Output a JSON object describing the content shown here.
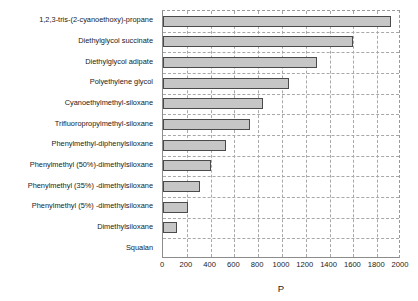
{
  "chart_data": {
    "type": "bar",
    "orientation": "horizontal",
    "title": "",
    "xlabel": "P",
    "ylabel": "",
    "xlim": [
      0,
      2000
    ],
    "xticks": [
      0,
      200,
      400,
      600,
      800,
      1000,
      1200,
      1400,
      1600,
      1800,
      2000
    ],
    "grid": true,
    "legend": false,
    "bar_fill_color": "#c6c6c6",
    "bar_border_color": "#4a4a4a",
    "categories": [
      "1,2,3-tris-(2-cyanoethoxy)-propane",
      "Diethylglycol succinate",
      "Diethylglycol adipate",
      "Polyethylene glycol",
      "Cyanoethylmethyl-siloxane",
      "Trifluoropropylmethyl-siloxane",
      "Phenylmethyl-diphenylsiloxane",
      "Phenylmethyl (50%)-dimethylsiloxane",
      "Phenylmethyl (35%) -dimethylsiloxane",
      "Phenylmethyl (5%) -dimethylsiloxane",
      "Dimethylsiloxane",
      "Squalan"
    ],
    "values": [
      1915,
      1595,
      1295,
      1060,
      840,
      730,
      530,
      400,
      310,
      210,
      120,
      0
    ]
  }
}
